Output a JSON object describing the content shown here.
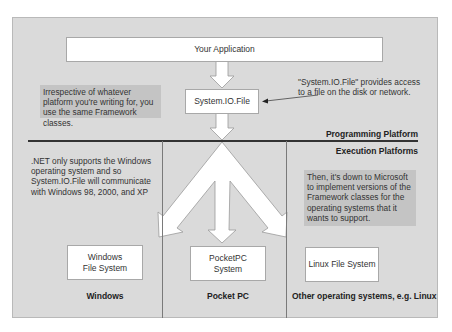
{
  "diagram": {
    "top_box": {
      "label": "Your Application"
    },
    "framework_box": {
      "label": "System.IO.File"
    },
    "left_callout": {
      "text": "Irrespective of whatever platform you're writing for, you use the same Framework classes."
    },
    "right_note": {
      "text": "\"System.IO.File\" provides access to a file on the disk or network."
    },
    "layers": {
      "programming": "Programming  Platform",
      "execution": "Execution Platforms"
    },
    "windows_note": {
      "text": ".NET only supports the Windows operating system and so System.IO.File will communicate with Windows 98, 2000, and XP"
    },
    "microsoft_callout": {
      "text": "Then, it's down to Microsoft to implement versions of the Framework classes for the operating systems that it wants to support."
    },
    "columns": [
      {
        "box": "Windows File System",
        "label": "Windows"
      },
      {
        "box": "PocketPC System",
        "label": "Pocket PC"
      },
      {
        "box": "Linux File System",
        "label": "Other operating systems, e.g. Linux"
      }
    ],
    "colors": {
      "panel": "#dadada",
      "callout": "#c4c4c4",
      "box": "#ffffff",
      "divider": "#333333"
    }
  }
}
